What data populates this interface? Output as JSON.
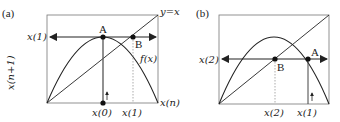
{
  "panels": [
    {
      "id": "a",
      "label": "(a)",
      "y_axis_label": "x(n+1)",
      "x_axis_label": "x(n)",
      "diagonal_label": "y=x",
      "curve_label": "f(x)",
      "y_tick_label": "x(1)",
      "x_tick_labels": [
        "x(0)",
        "x(1)"
      ],
      "points": [
        "A",
        "B"
      ]
    },
    {
      "id": "b",
      "label": "(b)",
      "y_tick_label": "x(2)",
      "x_tick_labels": [
        "x(2)",
        "x(1)"
      ],
      "points": [
        "A",
        "B"
      ]
    }
  ],
  "colors": {
    "line": "#222222",
    "dotted": "#888888",
    "frame": "#777777"
  }
}
